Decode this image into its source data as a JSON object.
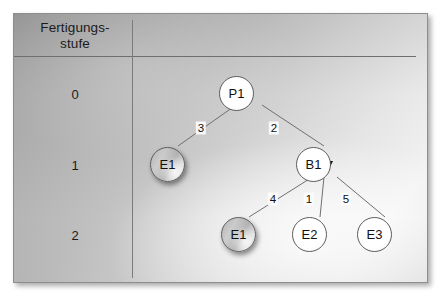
{
  "diagram": {
    "type": "directed-graph",
    "title_column_header": "Fertigungs-\nstufe",
    "column_header_line1": "Fertigungs-",
    "column_header_line2": "stufe",
    "levels": [
      {
        "label": "0",
        "y": 92
      },
      {
        "label": "1",
        "y": 163
      },
      {
        "label": "2",
        "y": 233
      }
    ],
    "nodes": [
      {
        "id": "P1",
        "label": "P1",
        "level": 0,
        "x": 235,
        "y": 92,
        "style": "white"
      },
      {
        "id": "E1a",
        "label": "E1",
        "level": 1,
        "x": 166,
        "y": 163,
        "style": "shaded"
      },
      {
        "id": "B1",
        "label": "B1",
        "level": 1,
        "x": 312,
        "y": 163,
        "style": "white"
      },
      {
        "id": "E1b",
        "label": "E1",
        "level": 2,
        "x": 237,
        "y": 233,
        "style": "shaded"
      },
      {
        "id": "E2",
        "label": "E2",
        "level": 2,
        "x": 308,
        "y": 233,
        "style": "white"
      },
      {
        "id": "E3",
        "label": "E3",
        "level": 2,
        "x": 373,
        "y": 233,
        "style": "white"
      }
    ],
    "edges": [
      {
        "from": "E1a",
        "to": "P1",
        "weight": "3",
        "label_x": 200,
        "label_y": 127
      },
      {
        "from": "B1",
        "to": "P1",
        "weight": "2",
        "label_x": 273,
        "label_y": 127
      },
      {
        "from": "E1b",
        "to": "B1",
        "weight": "4",
        "label_x": 272,
        "label_y": 198
      },
      {
        "from": "E2",
        "to": "B1",
        "weight": "1",
        "label_x": 308,
        "label_y": 198
      },
      {
        "from": "E3",
        "to": "B1",
        "weight": "5",
        "label_x": 345,
        "label_y": 198
      }
    ],
    "colors": {
      "line": "#6f6f6f",
      "arrowhead": "#101010",
      "text": "#141414",
      "node_border": "#5e5e5e",
      "panel_border": "#8d8d8d"
    }
  }
}
